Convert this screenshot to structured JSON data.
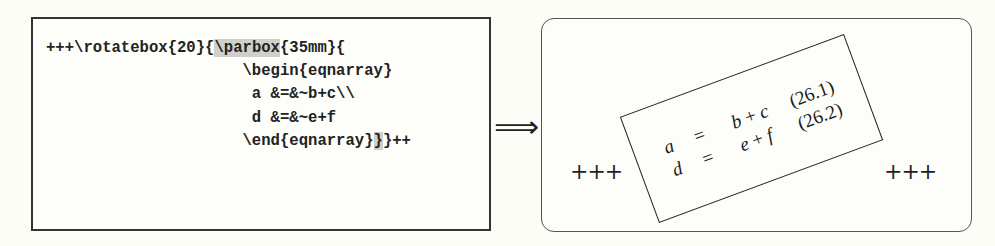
{
  "source": {
    "lines": [
      {
        "parts": [
          {
            "text": "+++\\rotatebox{20}{",
            "highlight": false
          },
          {
            "text": "\\parbox",
            "highlight": true
          },
          {
            "text": "{35mm}{",
            "highlight": false
          }
        ]
      },
      {
        "parts": [
          {
            "text": "                     \\begin{eqnarray}",
            "highlight": false
          }
        ]
      },
      {
        "parts": [
          {
            "text": "                      a &=&~b+c\\\\",
            "highlight": false
          }
        ]
      },
      {
        "parts": [
          {
            "text": "                      d &=&~e+f",
            "highlight": false
          }
        ]
      },
      {
        "parts": [
          {
            "text": "                     \\end{eqnarray}",
            "highlight": false
          },
          {
            "text": "}",
            "highlight": true
          },
          {
            "text": "}++",
            "highlight": false
          }
        ]
      }
    ],
    "highlight_color": "#cfcfcb"
  },
  "arrow": {
    "glyph": "⟹"
  },
  "result": {
    "prefix": "+++",
    "suffix": "+++",
    "rotation_deg": 20,
    "equations": [
      {
        "lhs": "a",
        "rel": "=",
        "rhs_a": "b",
        "op": "+",
        "rhs_b": "c",
        "number": "(26.1)"
      },
      {
        "lhs": "d",
        "rel": "=",
        "rhs_a": "e",
        "op": "+",
        "rhs_b": "f",
        "number": "(26.2)"
      }
    ]
  }
}
